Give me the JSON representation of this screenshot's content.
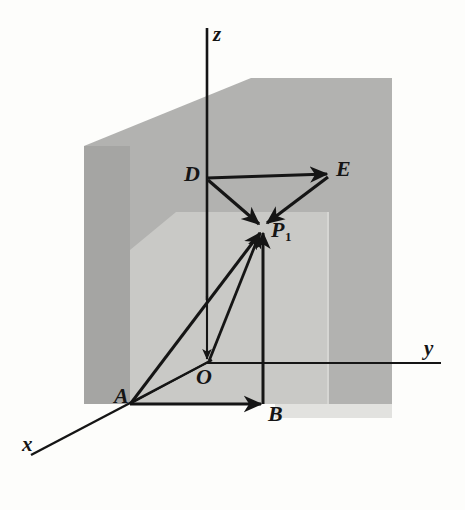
{
  "figure": {
    "kind": "3d-vector-decomposition-diagram",
    "background_color": "#fdfdfb",
    "ink_color": "#151515",
    "shade_back_wall_color": "#b0b0b0",
    "shade_side_wall_color": "#a3a3a3",
    "shade_inner_plane_color": "#c9c9c9",
    "shade_floor_shadow_color": "#d8d8d8"
  },
  "axes": {
    "x": {
      "label": "x",
      "label_x": 22,
      "label_y": 434
    },
    "y": {
      "label": "y",
      "label_x": 424,
      "label_y": 338
    },
    "z": {
      "label": "z",
      "label_x": 213,
      "label_y": 24
    }
  },
  "points": [
    {
      "name": "D",
      "label": "D",
      "sub": "",
      "label_x": 184,
      "label_y": 163,
      "x": 207,
      "y": 178
    },
    {
      "name": "E",
      "label": "E",
      "sub": "",
      "label_x": 336,
      "label_y": 158,
      "x": 330,
      "y": 172
    },
    {
      "name": "P1",
      "label": "P",
      "sub": "1",
      "label_x": 271,
      "label_y": 219,
      "x": 262,
      "y": 228
    },
    {
      "name": "A",
      "label": "A",
      "sub": "",
      "label_x": 114,
      "label_y": 385,
      "x": 130,
      "y": 404
    },
    {
      "name": "B",
      "label": "B",
      "sub": "",
      "label_x": 268,
      "label_y": 403,
      "x": 263,
      "y": 404
    },
    {
      "name": "O",
      "label": "O",
      "sub": "",
      "label_x": 196,
      "label_y": 366,
      "x": 207,
      "y": 363
    }
  ],
  "vectors": [
    {
      "name": "D-to-E",
      "from": "D",
      "to": "E",
      "arrowhead": true
    },
    {
      "name": "D-to-P1",
      "from": "D",
      "to": "P1",
      "arrowhead": true
    },
    {
      "name": "E-to-P1",
      "from": "E",
      "to": "P1",
      "arrowhead": true
    },
    {
      "name": "A-to-P1",
      "from": "A",
      "to": "P1",
      "arrowhead": true
    },
    {
      "name": "B-to-P1",
      "from": "B",
      "to": "P1",
      "arrowhead": true
    },
    {
      "name": "O-to-P1",
      "from": "O",
      "to": "P1",
      "arrowhead": true
    },
    {
      "name": "A-to-B",
      "from": "A",
      "to": "B",
      "arrowhead": true
    },
    {
      "name": "z-to-O",
      "from": "z",
      "to": "O",
      "arrowhead": true
    }
  ],
  "plain_lines": [
    {
      "name": "A-to-O-guide"
    },
    {
      "name": "O-y-axis"
    },
    {
      "name": "O-x-axis"
    },
    {
      "name": "z-axis-upper"
    }
  ]
}
